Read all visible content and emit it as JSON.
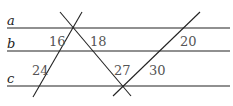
{
  "diagram": {
    "lines": [
      {
        "name": "a",
        "label": "a"
      },
      {
        "name": "b",
        "label": "b"
      },
      {
        "name": "c",
        "label": "c"
      }
    ],
    "segments": {
      "left_upper": "16",
      "mid_upper": "18",
      "right_upper": "20",
      "left_lower": "24",
      "mid_lower": "27",
      "right_lower": "30"
    },
    "colors": {
      "line": "#222222",
      "number": "#555555"
    }
  }
}
